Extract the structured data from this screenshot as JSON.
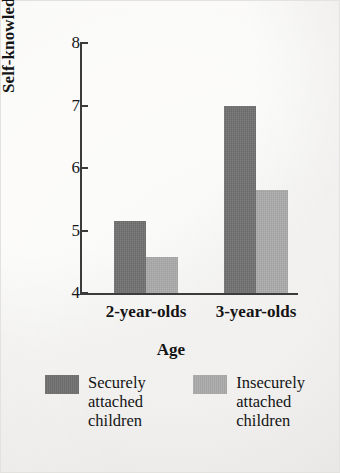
{
  "chart_data": {
    "type": "bar",
    "title": "",
    "subtitle": "",
    "xlabel": "Age",
    "ylabel": "Self-knowledge score",
    "categories": [
      "2-year-olds",
      "3-year-olds"
    ],
    "series": [
      {
        "name": "Securely attached children",
        "values": [
          5.15,
          7.0
        ],
        "color": "#6f6f6f"
      },
      {
        "name": "Insecurely attached children",
        "values": [
          4.57,
          5.65
        ],
        "color": "#a9a9a9"
      }
    ],
    "ylim": [
      4,
      8
    ],
    "yticks": [
      4,
      5,
      6,
      7,
      8
    ],
    "ytick_labels": [
      "4",
      "5",
      "6",
      "7",
      "8"
    ],
    "grid": false,
    "legend_position": "bottom",
    "legend": [
      {
        "label": "Securely attached children",
        "label_lines": "Securely\nattached\nchildren",
        "swatch": "#6f6f6f"
      },
      {
        "label": "Insecurely attached children",
        "label_lines": "Insecurely\nattached\nchildren",
        "swatch": "#a9a9a9"
      }
    ]
  },
  "figure": {
    "background": "#f3f2f0",
    "axis_color": "#3b3b3b",
    "text_color": "#141414"
  }
}
